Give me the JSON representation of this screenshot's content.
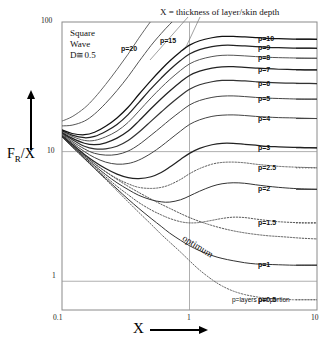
{
  "chart_data": {
    "type": "line",
    "title": "X = thickness of layer/skin depth",
    "xlabel": "X",
    "ylabel": "FR/X",
    "xscale": "log",
    "yscale": "log",
    "xlim": [
      0.1,
      10
    ],
    "ylim": [
      0.6,
      100
    ],
    "xticks": [
      "0.1",
      "1",
      "10"
    ],
    "yticks": [
      "1",
      "10",
      "100"
    ],
    "grid": true,
    "legend_position": "right-inline",
    "annotations": {
      "corner_note": [
        "Square",
        "Wave",
        "D≅0.5"
      ],
      "optimum": "optimum",
      "footnote": "p=layers per portion"
    },
    "x": [
      0.1,
      0.12,
      0.15,
      0.18,
      0.22,
      0.27,
      0.33,
      0.4,
      0.5,
      0.6,
      0.7,
      0.85,
      1.0,
      1.2,
      1.5,
      1.8,
      2.2,
      2.7,
      3.3,
      4.0,
      5.0,
      6.5,
      8.0,
      10.0
    ],
    "series": [
      {
        "name": "p=0.5",
        "label": "p=0.5",
        "style": "dotted",
        "color": "#666666",
        "values": [
          13.0,
          10.9,
          8.8,
          7.4,
          6.1,
          5.0,
          4.1,
          3.4,
          2.75,
          2.3,
          2.0,
          1.68,
          1.44,
          1.22,
          1.03,
          0.92,
          0.84,
          0.79,
          0.76,
          0.74,
          0.73,
          0.72,
          0.72,
          0.72
        ]
      },
      {
        "name": "p=1",
        "label": "p=1",
        "style": "solid",
        "color": "#333333",
        "values": [
          13.0,
          10.9,
          8.85,
          7.45,
          6.2,
          5.15,
          4.3,
          3.65,
          3.05,
          2.65,
          2.35,
          2.07,
          1.88,
          1.72,
          1.58,
          1.5,
          1.44,
          1.39,
          1.36,
          1.35,
          1.34,
          1.33,
          1.33,
          1.33
        ]
      },
      {
        "name": "p=1.5",
        "label": "p=1.5",
        "style": "dotted",
        "color": "#555555",
        "values": [
          13.1,
          11.0,
          8.95,
          7.6,
          6.4,
          5.4,
          4.65,
          4.05,
          3.55,
          3.25,
          3.05,
          2.88,
          2.82,
          2.84,
          2.95,
          3.05,
          3.12,
          3.1,
          3.02,
          2.95,
          2.88,
          2.84,
          2.82,
          2.82
        ]
      },
      {
        "name": "p=2",
        "label": "p=2",
        "style": "solid",
        "color": "#333333",
        "values": [
          13.1,
          11.1,
          9.1,
          7.8,
          6.65,
          5.75,
          5.1,
          4.6,
          4.25,
          4.1,
          4.08,
          4.25,
          4.55,
          4.95,
          5.4,
          5.65,
          5.75,
          5.7,
          5.55,
          5.42,
          5.3,
          5.2,
          5.15,
          5.12
        ]
      },
      {
        "name": "p=2.5",
        "label": "p=2.5",
        "style": "dotted",
        "color": "#555555",
        "values": [
          13.2,
          11.2,
          9.3,
          8.05,
          7.0,
          6.2,
          5.65,
          5.3,
          5.2,
          5.3,
          5.55,
          6.1,
          6.75,
          7.4,
          8.0,
          8.25,
          8.3,
          8.2,
          8.0,
          7.85,
          7.7,
          7.6,
          7.55,
          7.5
        ]
      },
      {
        "name": "p=3",
        "label": "p=3",
        "style": "solid",
        "color": "#222222",
        "values": [
          13.3,
          11.4,
          9.5,
          8.35,
          7.4,
          6.7,
          6.3,
          6.2,
          6.4,
          6.9,
          7.6,
          8.7,
          9.7,
          10.6,
          11.3,
          11.6,
          11.6,
          11.4,
          11.2,
          11.0,
          10.9,
          10.8,
          10.75,
          10.7
        ]
      },
      {
        "name": "p=4",
        "label": "p=4",
        "style": "solid",
        "color": "#444444",
        "values": [
          13.5,
          11.7,
          10.0,
          9.0,
          8.3,
          8.0,
          8.1,
          8.6,
          9.7,
          11.0,
          12.4,
          14.4,
          16.2,
          17.6,
          18.7,
          19.1,
          19.2,
          19.0,
          18.7,
          18.5,
          18.3,
          18.2,
          18.1,
          18.0
        ]
      },
      {
        "name": "p=5",
        "label": "p=5",
        "style": "solid",
        "color": "#444444",
        "values": [
          13.7,
          12.0,
          10.5,
          9.7,
          9.4,
          9.5,
          10.1,
          11.3,
          13.4,
          15.5,
          17.6,
          20.4,
          22.9,
          24.8,
          26.2,
          26.8,
          26.9,
          26.6,
          26.2,
          25.9,
          25.7,
          25.5,
          25.4,
          25.4
        ]
      },
      {
        "name": "p=6",
        "label": "p=6",
        "style": "solid",
        "color": "#333333",
        "values": [
          13.9,
          12.4,
          11.0,
          10.5,
          10.5,
          11.0,
          12.2,
          14.1,
          17.2,
          20.2,
          23.1,
          27.0,
          30.3,
          32.8,
          34.6,
          35.4,
          35.5,
          35.1,
          34.6,
          34.2,
          33.9,
          33.7,
          33.6,
          33.5
        ]
      },
      {
        "name": "p=7",
        "label": "p=7",
        "style": "solid",
        "color": "#222222",
        "values": [
          14.1,
          12.7,
          11.6,
          11.3,
          11.7,
          12.7,
          14.4,
          17.2,
          21.5,
          25.6,
          29.4,
          34.5,
          38.7,
          41.8,
          44.1,
          45.1,
          45.2,
          44.7,
          44.1,
          43.6,
          43.2,
          43.0,
          42.8,
          42.7
        ]
      },
      {
        "name": "p=8",
        "label": "p=8",
        "style": "solid",
        "color": "#555555",
        "values": [
          14.3,
          13.1,
          12.2,
          12.2,
          13.0,
          14.4,
          16.8,
          20.5,
          26.0,
          31.2,
          36.0,
          42.3,
          47.5,
          51.3,
          54.1,
          55.3,
          55.4,
          54.8,
          54.1,
          53.5,
          53.1,
          52.8,
          52.6,
          52.5
        ]
      },
      {
        "name": "p=9",
        "label": "p=9",
        "style": "solid",
        "color": "#222222",
        "values": [
          14.5,
          13.4,
          12.8,
          13.1,
          14.3,
          16.2,
          19.3,
          23.9,
          30.6,
          36.9,
          42.8,
          50.4,
          56.6,
          61.2,
          64.5,
          66.0,
          66.1,
          65.4,
          64.5,
          63.8,
          63.3,
          63.0,
          62.8,
          62.7
        ]
      },
      {
        "name": "p=10",
        "label": "p=10",
        "style": "solid",
        "color": "#111111",
        "values": [
          14.7,
          13.8,
          13.5,
          14.1,
          15.7,
          18.2,
          22.0,
          27.6,
          35.5,
          43.0,
          50.0,
          59.0,
          66.3,
          71.7,
          75.6,
          77.4,
          77.5,
          76.7,
          75.7,
          74.9,
          74.3,
          73.9,
          73.7,
          73.6
        ]
      },
      {
        "name": "p=15",
        "label": "p=15",
        "style": "solid",
        "color": "#555555",
        "values": [
          15.8,
          16.0,
          17.2,
          19.5,
          23.6,
          29.6,
          37.9,
          49.3,
          66.0,
          81.5,
          96.0,
          115.0,
          130.0,
          141.0,
          149.0,
          153.0,
          153.5,
          152.0,
          150.0,
          148.5,
          147.5,
          146.8,
          146.4,
          146.2
        ]
      },
      {
        "name": "p=20",
        "label": "p=20",
        "style": "solid",
        "color": "#666666",
        "values": [
          17.2,
          18.6,
          21.7,
          26.0,
          33.0,
          43.0,
          56.5,
          75.0,
          102.0,
          127.0,
          150.0,
          181.0,
          205.0,
          222.0,
          235.0,
          241.0,
          242.0,
          240.0,
          237.0,
          235.0,
          233.0,
          232.0,
          231.0,
          230.5
        ]
      }
    ],
    "optimum_curve": {
      "name": "optimum",
      "style": "dotted",
      "color": "#555555",
      "x": [
        0.1,
        0.15,
        0.22,
        0.33,
        0.5,
        0.7,
        1.0,
        1.4,
        2.0,
        2.8,
        4.0,
        5.5,
        7.5,
        10.0
      ],
      "values": [
        13.0,
        9.3,
        7.0,
        5.4,
        4.3,
        3.65,
        3.1,
        2.75,
        2.5,
        2.35,
        2.25,
        2.2,
        2.15,
        2.12
      ]
    }
  },
  "leaders": [
    {
      "name": "p=20",
      "label": "p=20"
    },
    {
      "name": "p=15",
      "label": "p=15"
    }
  ]
}
